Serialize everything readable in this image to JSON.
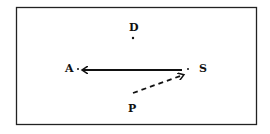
{
  "diagram": {
    "points": [
      {
        "id": "D",
        "label": "D"
      },
      {
        "id": "A",
        "label": "A"
      },
      {
        "id": "S",
        "label": "S"
      },
      {
        "id": "P",
        "label": "P"
      }
    ],
    "edges": [
      {
        "from": "S",
        "to": "A",
        "style": "solid",
        "arrow": "end"
      },
      {
        "from": "P",
        "to": "S",
        "style": "dashed",
        "arrow": "end"
      }
    ],
    "colors": {
      "ink": "#111111",
      "frame": "#222222"
    }
  }
}
